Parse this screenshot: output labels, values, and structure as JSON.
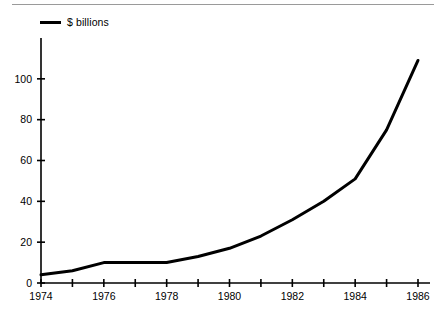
{
  "legend": {
    "swatch_name": "line-swatch",
    "label": "$ billions",
    "color": "#000000"
  },
  "chart_data": {
    "type": "line",
    "title": "",
    "subtitle": "",
    "xlabel": "",
    "ylabel": "",
    "legend_position": "top-left",
    "grid": false,
    "xlim": [
      1974,
      1986
    ],
    "ylim": [
      0,
      120
    ],
    "x": [
      1974,
      1975,
      1976,
      1977,
      1978,
      1979,
      1980,
      1981,
      1982,
      1983,
      1984,
      1985,
      1986
    ],
    "series": [
      {
        "name": "$ billions",
        "color": "#000000",
        "values": [
          4,
          6,
          10,
          10,
          10,
          13,
          17,
          23,
          31,
          40,
          51,
          75,
          109
        ]
      }
    ],
    "ytick_values": [
      0,
      20,
      40,
      60,
      80,
      100
    ],
    "ytick_labels": [
      "0",
      "20",
      "40",
      "60",
      "80",
      "100"
    ],
    "xtick_values": [
      1974,
      1975,
      1976,
      1977,
      1978,
      1979,
      1980,
      1981,
      1982,
      1983,
      1984,
      1985,
      1986
    ],
    "xtick_labels": [
      "1974",
      "",
      "1976",
      "",
      "1978",
      "",
      "1980",
      "",
      "1982",
      "",
      "1984",
      "",
      "1986"
    ],
    "xtick_labels_shown": [
      "1974",
      "1976",
      "1978",
      "1980",
      "1982",
      "1984",
      "1986"
    ],
    "axis_color": "#000000",
    "line_width": 3
  }
}
